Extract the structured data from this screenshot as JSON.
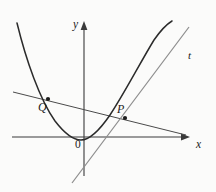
{
  "figure": {
    "type": "math-diagram",
    "background_color": "#fbfbfa",
    "width": 216,
    "height": 192
  },
  "axes": {
    "x_label": "x",
    "y_label": "y",
    "origin_label": "0",
    "axis_color": "#3a3a3a",
    "origin_px": {
      "x": 84,
      "y": 137
    },
    "x_axis": {
      "x1": 12,
      "y1": 137,
      "x2": 190,
      "y2": 137,
      "arrow": "right"
    },
    "y_axis": {
      "x1": 84,
      "y1": 175,
      "x2": 84,
      "y2": 22,
      "arrow": "up"
    },
    "x_label_pos": {
      "x": 196,
      "y": 140
    },
    "y_label_pos": {
      "x": 74,
      "y": 22
    },
    "origin_label_pos": {
      "x": 75,
      "y": 142
    }
  },
  "curve": {
    "name": "parabola",
    "color": "#2b2b2b",
    "stroke_width": 1.4,
    "vertex_px": {
      "x": 80,
      "y": 140
    },
    "left_end_px": {
      "x": 17,
      "y": 23
    },
    "right_end_px": {
      "x": 172,
      "y": 21
    },
    "path": "M 17,23 Q 33,96 52,120 Q 68,140 80,140 Q 95,140 112,112 Q 130,80 146,55 Q 160,35 172,21"
  },
  "lines": [
    {
      "name": "tangent-line",
      "label": "t",
      "color": "#8a8a8a",
      "stroke_width": 1.2,
      "from_px": {
        "x": 72,
        "y": 183
      },
      "to_px": {
        "x": 189,
        "y": 27
      },
      "label_pos": {
        "x": 189,
        "y": 51
      }
    },
    {
      "name": "secant-line",
      "label": "",
      "color": "#4a4a4a",
      "stroke_width": 1.0,
      "from_px": {
        "x": 13,
        "y": 92
      },
      "to_px": {
        "x": 186,
        "y": 135
      }
    }
  ],
  "points": [
    {
      "name": "point-Q",
      "label": "Q",
      "px": {
        "x": 48,
        "y": 99
      },
      "label_pos": {
        "x": 39,
        "y": 102
      },
      "radius": 2.1,
      "color": "#1c1c1c"
    },
    {
      "name": "point-P",
      "label": "P",
      "px": {
        "x": 125,
        "y": 118
      },
      "label_pos": {
        "x": 118,
        "y": 104
      },
      "radius": 2.1,
      "color": "#1c1c1c"
    }
  ]
}
